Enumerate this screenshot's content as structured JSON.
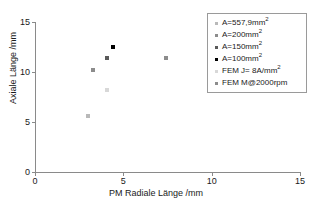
{
  "chart_data": {
    "type": "scatter",
    "title": "",
    "xlabel": "PM Radiale Länge /mm",
    "ylabel": "Axiale Länge /mm",
    "xlim": [
      0,
      15
    ],
    "ylim": [
      0,
      15
    ],
    "xticks": [
      "0",
      "5",
      "10",
      "15"
    ],
    "xtick_values": [
      0,
      5,
      10,
      15
    ],
    "yticks": [
      "0",
      "5",
      "10",
      "15"
    ],
    "ytick_values": [
      0,
      5,
      10,
      15
    ],
    "grid": false,
    "legend_position": "upper right",
    "series": [
      {
        "name": "A=557,9mm²",
        "label_base": "A=557,9mm",
        "label_sup": "2",
        "color": "#b9b9b9",
        "marker": "square",
        "points": [
          {
            "x": 3.0,
            "y": 5.6
          }
        ]
      },
      {
        "name": "A=200mm²",
        "label_base": "A=200mm",
        "label_sup": "2",
        "color": "#8c8c8c",
        "marker": "square",
        "points": [
          {
            "x": 3.3,
            "y": 10.2
          }
        ]
      },
      {
        "name": "A=150mm²",
        "label_base": "A=150mm",
        "label_sup": "2",
        "color": "#5a5a5a",
        "marker": "square",
        "points": [
          {
            "x": 4.1,
            "y": 11.4
          }
        ]
      },
      {
        "name": "A=100mm²",
        "label_base": "A=100mm",
        "label_sup": "2",
        "color": "#000000",
        "marker": "square",
        "points": [
          {
            "x": 4.4,
            "y": 12.5
          }
        ]
      },
      {
        "name": "FEM J= 8A/mm²",
        "label_base": "FEM J= 8A/mm",
        "label_sup": "2",
        "color": "#d8d8d8",
        "marker": "square",
        "points": [
          {
            "x": 4.1,
            "y": 8.2
          }
        ]
      },
      {
        "name": "FEM M@2000rpm",
        "label_base": "FEM M@2000rpm",
        "label_sup": "",
        "color": "#8c8c8c",
        "marker": "square",
        "points": [
          {
            "x": 7.4,
            "y": 11.4
          }
        ]
      }
    ]
  }
}
